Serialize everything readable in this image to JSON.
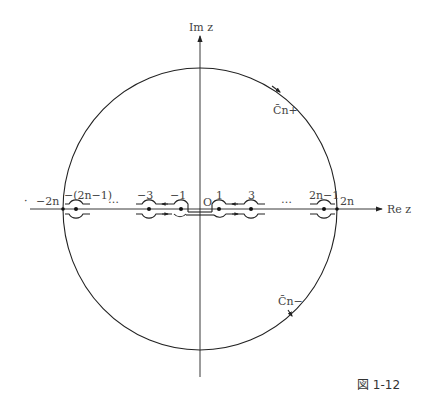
{
  "figure": {
    "caption": "図 1-12",
    "axes": {
      "real_label": "Re z",
      "imag_label": "Im z",
      "origin_label": "O"
    },
    "contours": {
      "upper_label": "C̄n+",
      "lower_label": "C̄n−"
    },
    "points": [
      {
        "label": "−2n",
        "value": "-2n"
      },
      {
        "label": "−(2n−1)",
        "value": "-(2n-1)"
      },
      {
        "label": "−3",
        "value": "-3"
      },
      {
        "label": "−1",
        "value": "-1"
      },
      {
        "label": "1",
        "value": "1"
      },
      {
        "label": "3",
        "value": "3"
      },
      {
        "label": "2n−1",
        "value": "2n-1"
      },
      {
        "label": "2n",
        "value": "2n"
      }
    ],
    "ellipsis": [
      "…",
      "…"
    ],
    "left_mark": "·",
    "colors": {
      "line": "#222222",
      "text": "#444444",
      "background": "#ffffff"
    }
  }
}
